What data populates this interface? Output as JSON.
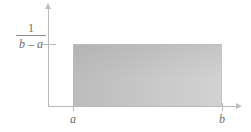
{
  "figure": {
    "name": "uniform-distribution-density",
    "axes": {
      "y_axis_label": "",
      "x_axis_label": ""
    },
    "y_tick": {
      "numerator": "1",
      "denominator": "b – a"
    },
    "x_ticks": [
      {
        "label": "a"
      },
      {
        "label": "b"
      }
    ],
    "colors": {
      "axis": "#b9b9b9",
      "fill_left": "#bcbcbc",
      "fill_right": "#d2d2d2",
      "text": "#6d6d6d"
    }
  },
  "chart_data": {
    "type": "area",
    "title": "",
    "subtitle": "",
    "xlabel": "",
    "ylabel": "",
    "grid": false,
    "legend": null,
    "x": [
      "a",
      "b"
    ],
    "series": [
      {
        "name": "uniform density",
        "values": [
          "1/(b – a)",
          "1/(b – a)"
        ]
      }
    ],
    "annotations": [
      {
        "text": "1",
        "role": "y-tick-numerator"
      },
      {
        "text": "b – a",
        "role": "y-tick-denominator"
      },
      {
        "text": "a",
        "role": "x-tick-left"
      },
      {
        "text": "b",
        "role": "x-tick-right"
      }
    ],
    "xlim": [
      "a",
      "b"
    ],
    "ylim": [
      0,
      "1/(b – a)"
    ]
  }
}
